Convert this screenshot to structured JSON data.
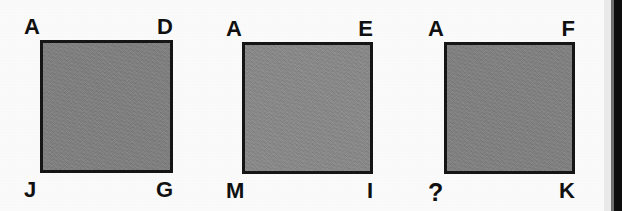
{
  "page": {
    "width": 622,
    "height": 211,
    "background_color": "#fcfcfc",
    "kind": "scanned-geometry-figure"
  },
  "colors": {
    "square_border": "#151515",
    "square_fill_1": "#7f7f7f",
    "square_fill_2": "#898989",
    "square_fill_3": "#808080",
    "label_color": "#101010",
    "scan_edge_dark": "#0d0d0d",
    "scan_edge_mid": "#6f6f6f",
    "scan_edge_light": "#e9e9e9"
  },
  "figures": [
    {
      "id": "figure-1",
      "name": "square-adjg",
      "x": 40,
      "y": 40,
      "width": 133,
      "height": 133,
      "fill": "#7f7f7f",
      "corners": {
        "top_left": "A",
        "top_right": "D",
        "bottom_left": "J",
        "bottom_right": "G"
      }
    },
    {
      "id": "figure-2",
      "name": "square-aemi",
      "x": 242,
      "y": 42,
      "width": 131,
      "height": 132,
      "fill": "#898989",
      "corners": {
        "top_left": "A",
        "top_right": "E",
        "bottom_left": "M",
        "bottom_right": "I"
      }
    },
    {
      "id": "figure-3",
      "name": "square-afqk",
      "x": 444,
      "y": 42,
      "width": 131,
      "height": 132,
      "fill": "#808080",
      "corners": {
        "top_left": "A",
        "top_right": "F",
        "bottom_left": "?",
        "bottom_right": "K"
      }
    }
  ],
  "scan_edge": {
    "light_x": 604,
    "light_width": 7,
    "mid_x": 611,
    "mid_width": 3,
    "dark_x": 614,
    "dark_width": 8
  }
}
